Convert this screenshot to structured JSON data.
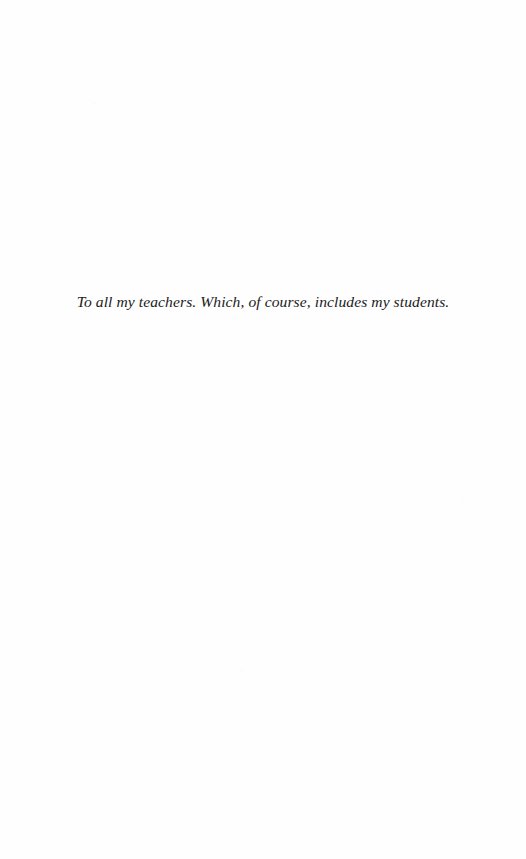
{
  "page": {
    "kind": "book-dedication-page",
    "background_color": "#fefefe",
    "text_color": "#1b1b1b",
    "width": 526,
    "height": 859
  },
  "dedication": {
    "line": "To all my teachers. Which, of course, includes my students."
  }
}
